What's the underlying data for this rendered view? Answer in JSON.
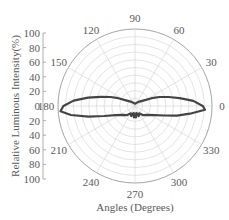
{
  "chart_data": {
    "type": "polar",
    "title": "",
    "xlabel": "Angles (Degrees)",
    "ylabel": "Relative Luminous Intensity(%)",
    "angular_ticks": [
      0,
      30,
      60,
      90,
      120,
      150,
      180,
      210,
      240,
      270,
      300,
      330
    ],
    "radial_ticks": [
      0,
      20,
      40,
      60,
      80,
      100
    ],
    "radial_axis_labels": [
      "100",
      "80",
      "60",
      "40",
      "20",
      "0",
      "20",
      "40",
      "60",
      "80",
      "100"
    ],
    "rlim": [
      0,
      100
    ],
    "grid": true,
    "legend": null,
    "series": [
      {
        "name": "Relative Luminous Intensity",
        "color": "#444444",
        "points": [
          {
            "angle": 0,
            "r": 88
          },
          {
            "angle": 5,
            "r": 76
          },
          {
            "angle": 10,
            "r": 59
          },
          {
            "angle": 15,
            "r": 45
          },
          {
            "angle": 20,
            "r": 34
          },
          {
            "angle": 25,
            "r": 24
          },
          {
            "angle": 31,
            "r": 15
          },
          {
            "angle": 45,
            "r": 8
          },
          {
            "angle": 70,
            "r": 4
          },
          {
            "angle": 90,
            "r": 3
          },
          {
            "angle": 110,
            "r": 4
          },
          {
            "angle": 135,
            "r": 8
          },
          {
            "angle": 149,
            "r": 15
          },
          {
            "angle": 155,
            "r": 24
          },
          {
            "angle": 160,
            "r": 34
          },
          {
            "angle": 165,
            "r": 46
          },
          {
            "angle": 170,
            "r": 62
          },
          {
            "angle": 175,
            "r": 80
          },
          {
            "angle": 180,
            "r": 93
          },
          {
            "angle": 184,
            "r": 97
          },
          {
            "angle": 188,
            "r": 84
          },
          {
            "angle": 193,
            "r": 62
          },
          {
            "angle": 198,
            "r": 42
          },
          {
            "angle": 205,
            "r": 28
          },
          {
            "angle": 215,
            "r": 20
          },
          {
            "angle": 228,
            "r": 16
          },
          {
            "angle": 240,
            "r": 11
          },
          {
            "angle": 250,
            "r": 14
          },
          {
            "angle": 258,
            "r": 9
          },
          {
            "angle": 265,
            "r": 15
          },
          {
            "angle": 270,
            "r": 11
          },
          {
            "angle": 275,
            "r": 15
          },
          {
            "angle": 282,
            "r": 9
          },
          {
            "angle": 290,
            "r": 14
          },
          {
            "angle": 300,
            "r": 11
          },
          {
            "angle": 312,
            "r": 16
          },
          {
            "angle": 325,
            "r": 20
          },
          {
            "angle": 335,
            "r": 28
          },
          {
            "angle": 342,
            "r": 40
          },
          {
            "angle": 347,
            "r": 56
          },
          {
            "angle": 352,
            "r": 72
          },
          {
            "angle": 357,
            "r": 91
          },
          {
            "angle": 360,
            "r": 88
          }
        ]
      }
    ]
  }
}
